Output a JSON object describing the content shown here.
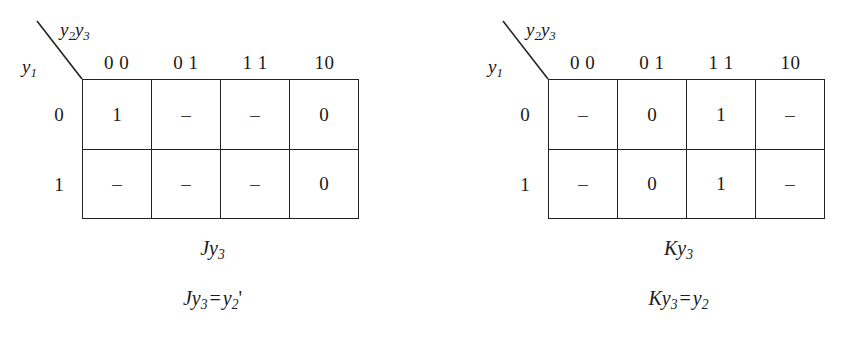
{
  "figure": {
    "background_color": "#ffffff",
    "line_color": "#222222",
    "text_color": "#1a1a1a"
  },
  "maps": [
    {
      "id": "left",
      "axis_cols_var": "y",
      "axis_cols_sub_1": "2",
      "axis_cols_var2": "y",
      "axis_cols_sub_2": "3",
      "axis_rows_var": "y",
      "axis_rows_sub": "1",
      "col_headers": [
        "0 0",
        "0 1",
        "1 1",
        "10"
      ],
      "row_headers": [
        "0",
        "1"
      ],
      "cells": [
        [
          "1",
          "–",
          "–",
          "0"
        ],
        [
          "–",
          "–",
          "–",
          "0"
        ]
      ],
      "name_main": "J",
      "name_var": "y",
      "name_sub": "3",
      "equation": {
        "lhs_main": "J",
        "lhs_var": "y",
        "lhs_sub": "3",
        "operator": "=",
        "rhs_var": "y",
        "rhs_sub": "2",
        "rhs_prime": "'"
      }
    },
    {
      "id": "right",
      "axis_cols_var": "y",
      "axis_cols_sub_1": "2",
      "axis_cols_var2": "y",
      "axis_cols_sub_2": "3",
      "axis_rows_var": "y",
      "axis_rows_sub": "1",
      "col_headers": [
        "0 0",
        "0 1",
        "1 1",
        "10"
      ],
      "row_headers": [
        "0",
        "1"
      ],
      "cells": [
        [
          "–",
          "0",
          "1",
          "–"
        ],
        [
          "–",
          "0",
          "1",
          "–"
        ]
      ],
      "name_main": "K",
      "name_var": "y",
      "name_sub": "3",
      "equation": {
        "lhs_main": "K",
        "lhs_var": "y",
        "lhs_sub": "3",
        "operator": "=",
        "rhs_var": "y",
        "rhs_sub": "2",
        "rhs_prime": ""
      }
    }
  ]
}
